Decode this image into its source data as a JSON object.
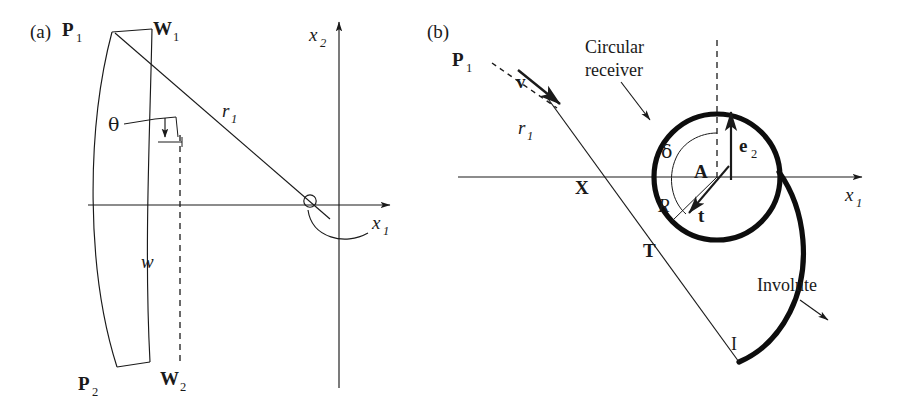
{
  "figure": {
    "type": "scientific-line-diagram",
    "background": "#ffffff",
    "ink_color": "#1a1a1a",
    "panels": [
      {
        "id": "a",
        "tag": "(a)",
        "description": "Heliostat / curved mirror facet with width w tilted by angle theta, aimed along ray r1 toward the origin of the x1-x2 coordinate frame",
        "labels": {
          "p1": "P",
          "p1_sub": "1",
          "p2": "P",
          "p2_sub": "2",
          "w1": "W",
          "w1_sub": "1",
          "w2": "W",
          "w2_sub": "2",
          "theta": "θ",
          "width": "w",
          "ray": "r",
          "ray_sub": "1",
          "axis_x1": "x",
          "axis_x1_sub": "1",
          "axis_x2": "x",
          "axis_x2_sub": "2"
        }
      },
      {
        "id": "b",
        "tag": "(b)",
        "description": "Circular receiver of radius R centred at A, incoming ray r1 from P1 along direction v grazing the circle at tangent point T, crossing the x1 axis at X; the involute curve ends at point I",
        "labels": {
          "p1": "P",
          "p1_sub": "1",
          "v": "v",
          "ray": "r",
          "ray_sub": "1",
          "circular_receiver": "Circular\nreceiver",
          "circular_receiver_line1": "Circular",
          "circular_receiver_line2": "receiver",
          "delta": "δ",
          "center": "A",
          "e2": "e",
          "e2_sub": "2",
          "radius": "R",
          "tangent_vector": "t",
          "tangent_point": "T",
          "x_point": "X",
          "involute": "Involute",
          "involute_point": "I",
          "axis_x1": "x",
          "axis_x1_sub": "1"
        }
      }
    ]
  }
}
